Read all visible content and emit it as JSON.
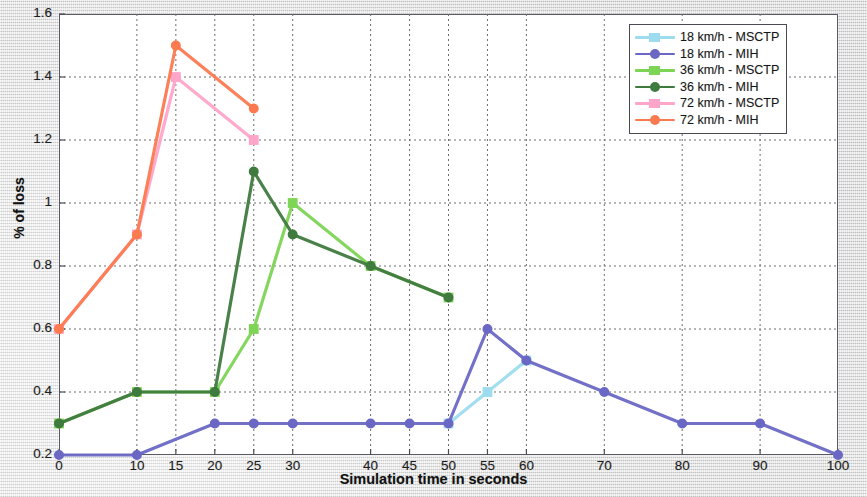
{
  "chart_data": {
    "type": "line",
    "title": "",
    "xlabel": "Simulation time in seconds",
    "ylabel": "% of loss",
    "xlim": [
      0,
      100
    ],
    "ylim": [
      0.2,
      1.6
    ],
    "grid": true,
    "legend_position": "top-right",
    "xticks": [
      0,
      10,
      15,
      20,
      25,
      30,
      40,
      45,
      50,
      55,
      60,
      70,
      80,
      90,
      100
    ],
    "xtick_labels": [
      "0",
      "10",
      "15",
      "20",
      "25",
      "30",
      "40",
      "45",
      "50",
      "55",
      "60",
      "70",
      "80",
      "90",
      "100"
    ],
    "yticks": [
      0.2,
      0.4,
      0.6,
      0.8,
      1,
      1.2,
      1.4,
      1.6
    ],
    "ytick_labels": [
      "0.2",
      "0.4",
      "0.6",
      "0.8",
      "1",
      "1.2",
      "1.4",
      "1.6"
    ],
    "series": [
      {
        "name": "18 km/h - MSCTP",
        "color": "#9cdcee",
        "marker": "square",
        "x": [
          50,
          55,
          60
        ],
        "values": [
          0.3,
          0.4,
          0.5
        ]
      },
      {
        "name": "18 km/h - MIH",
        "color": "#6a68c4",
        "marker": "circle",
        "x": [
          0,
          10,
          20,
          25,
          30,
          40,
          45,
          50,
          55,
          60,
          70,
          80,
          90,
          100
        ],
        "values": [
          0.2,
          0.2,
          0.3,
          0.3,
          0.3,
          0.3,
          0.3,
          0.3,
          0.6,
          0.5,
          0.4,
          0.3,
          0.3,
          0.2
        ]
      },
      {
        "name": "36 km/h - MSCTP",
        "color": "#7ed455",
        "marker": "square",
        "x": [
          0,
          10,
          20,
          25,
          30,
          40,
          50
        ],
        "values": [
          0.3,
          0.4,
          0.4,
          0.6,
          1.0,
          0.8,
          0.7
        ]
      },
      {
        "name": "36 km/h - MIH",
        "color": "#3f7a3f",
        "marker": "circle",
        "x": [
          0,
          10,
          20,
          25,
          30,
          40,
          50
        ],
        "values": [
          0.3,
          0.4,
          0.4,
          1.1,
          0.9,
          0.8,
          0.7
        ]
      },
      {
        "name": "72 km/h - MSCTP",
        "color": "#ffa5c9",
        "marker": "square",
        "x": [
          0,
          10,
          15,
          25
        ],
        "values": [
          0.6,
          0.9,
          1.4,
          1.2
        ]
      },
      {
        "name": "72 km/h - MIH",
        "color": "#fc7a4f",
        "marker": "circle",
        "x": [
          0,
          10,
          15,
          25
        ],
        "values": [
          0.6,
          0.9,
          1.5,
          1.3
        ]
      }
    ]
  },
  "legend": {
    "entries": [
      "18 km/h - MSCTP",
      "18 km/h - MIH",
      "36 km/h - MSCTP",
      "36 km/h - MIH",
      "72 km/h - MSCTP",
      "72 km/h - MIH"
    ]
  }
}
